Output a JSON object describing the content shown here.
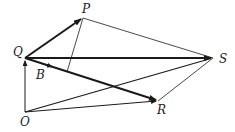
{
  "diagram": {
    "type": "vector-diagram",
    "points": {
      "Q": {
        "label": "Q",
        "x": 25,
        "y": 58
      },
      "P": {
        "label": "P",
        "x": 83,
        "y": 18
      },
      "S": {
        "label": "S",
        "x": 213,
        "y": 58
      },
      "R": {
        "label": "R",
        "x": 158,
        "y": 101
      },
      "O": {
        "label": "O",
        "x": 25,
        "y": 112
      },
      "B": {
        "label": "B"
      }
    },
    "colors": {
      "line": "#1a1a1a",
      "background": "#ffffff"
    }
  }
}
